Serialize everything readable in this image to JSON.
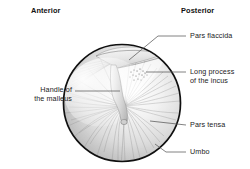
{
  "figure": {
    "type": "anatomical-diagram",
    "orientation_headers": [
      {
        "name": "anterior",
        "text": "Anterior"
      },
      {
        "name": "posterior",
        "text": "Posterior"
      }
    ],
    "labels": [
      {
        "name": "pars-flaccida",
        "text": "Pars flaccida"
      },
      {
        "name": "long-process-incus-1",
        "text": "Long process"
      },
      {
        "name": "long-process-incus-2",
        "text": "of the incus"
      },
      {
        "name": "pars-tensa",
        "text": "Pars tensa"
      },
      {
        "name": "umbo",
        "text": "Umbo"
      },
      {
        "name": "handle-malleus-1",
        "text": "Handle of"
      },
      {
        "name": "handle-malleus-2",
        "text": "the malleus"
      }
    ],
    "colors": {
      "outline": "#101010",
      "leader": "#585858",
      "text": "#1b1b1b",
      "membrane_light": "#fdfdfd",
      "membrane_mid": "#d2d2d2",
      "membrane_dark": "#9a9a9a",
      "fiber": "#8d8d8d",
      "background": "#ffffff"
    },
    "geometry": {
      "membrane_cx": 122,
      "membrane_cy": 103,
      "membrane_rx": 59,
      "membrane_ry": 59
    }
  }
}
